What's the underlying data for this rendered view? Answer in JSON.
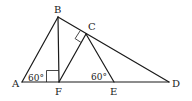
{
  "diagram": {
    "type": "geometry",
    "points": {
      "A": {
        "label": "A",
        "x": 22,
        "y": 82
      },
      "B": {
        "label": "B",
        "x": 58,
        "y": 17
      },
      "C": {
        "label": "C",
        "x": 86,
        "y": 34
      },
      "D": {
        "label": "D",
        "x": 169,
        "y": 82
      },
      "E": {
        "label": "E",
        "x": 114,
        "y": 82
      },
      "F": {
        "label": "F",
        "x": 59,
        "y": 82
      }
    },
    "segments": [
      "AB",
      "BD",
      "AD",
      "BF",
      "FC",
      "CE"
    ],
    "right_angles": [
      "BFA",
      "BCF"
    ],
    "angles": {
      "A": {
        "text": "60°"
      },
      "E": {
        "text": "60°"
      }
    },
    "stroke_color": "#1a1a1a"
  }
}
